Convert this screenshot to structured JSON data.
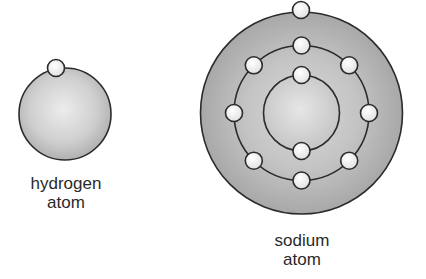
{
  "diagram": {
    "atoms": [
      {
        "name": "hydrogen",
        "label_line1": "hydrogen",
        "label_line2": "atom",
        "shells": [
          1
        ],
        "electron_count": 1
      },
      {
        "name": "sodium",
        "label_line1": "sodium",
        "label_line2": "atom",
        "shells": [
          2,
          8,
          1
        ],
        "electron_count": 11
      }
    ],
    "colors": {
      "nucleus_fill": "#cfcfcf",
      "shell_fill": "#b8b8b8",
      "outline": "#2b2b2b",
      "electron_fill": "#f7f7f7"
    }
  }
}
